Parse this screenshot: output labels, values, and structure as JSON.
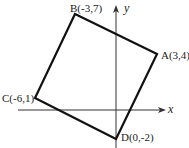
{
  "diagram": {
    "type": "coordinate-plane-square",
    "axes": {
      "x_label": "x",
      "y_label": "y"
    },
    "points": [
      {
        "name": "A",
        "label": "A(3,4)",
        "x": 3,
        "y": 4
      },
      {
        "name": "B",
        "label": "B(-3,7)",
        "x": -3,
        "y": 7
      },
      {
        "name": "C",
        "label": "C(-6,1)",
        "x": -6,
        "y": 1
      },
      {
        "name": "D",
        "label": "D(0,-2)",
        "x": 0,
        "y": -2
      }
    ],
    "colors": {
      "stroke": "#111111",
      "axis": "#333333",
      "background": "#ffffff"
    }
  }
}
